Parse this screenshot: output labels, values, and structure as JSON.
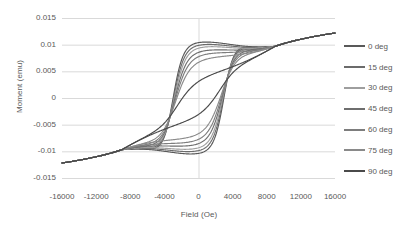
{
  "chart_data": {
    "type": "line",
    "title": "",
    "xlabel": "Field (Oe)",
    "ylabel": "Moment (emu)",
    "xlim": [
      -16000,
      16000
    ],
    "ylim": [
      -0.015,
      0.015
    ],
    "xticks": [
      "-16000",
      "-12000",
      "-8000",
      "-4000",
      "0",
      "4000",
      "8000",
      "12000",
      "16000"
    ],
    "xtick_values": [
      -16000,
      -12000,
      -8000,
      -4000,
      0,
      4000,
      8000,
      12000,
      16000
    ],
    "yticks": [
      "0.015",
      "0.01",
      "0.005",
      "0",
      "-0.005",
      "-0.01",
      "-0.015"
    ],
    "ytick_values": [
      0.015,
      0.01,
      0.005,
      0,
      -0.005,
      -0.01,
      -0.015
    ],
    "grid": true,
    "grid_color": "#d9d9d9",
    "legend_position": "right",
    "series": [
      {
        "name": "0 deg",
        "color": "#595959",
        "saturation": 0.0119,
        "remanence": 0.0082,
        "coercivity": 3050,
        "squareness": 0.88,
        "sharpness": 2.7
      },
      {
        "name": "15 deg",
        "color": "#6b6b6b",
        "saturation": 0.0119,
        "remanence": 0.008,
        "coercivity": 3000,
        "squareness": 0.84,
        "sharpness": 2.5
      },
      {
        "name": "30 deg",
        "color": "#9e9e9e",
        "saturation": 0.0119,
        "remanence": 0.0077,
        "coercivity": 2950,
        "squareness": 0.8,
        "sharpness": 2.3
      },
      {
        "name": "45 deg",
        "color": "#6e6e6e",
        "saturation": 0.0119,
        "remanence": 0.0074,
        "coercivity": 2900,
        "squareness": 0.74,
        "sharpness": 2.1
      },
      {
        "name": "60 deg",
        "color": "#7d7d7d",
        "saturation": 0.0119,
        "remanence": 0.007,
        "coercivity": 2850,
        "squareness": 0.68,
        "sharpness": 1.9
      },
      {
        "name": "75 deg",
        "color": "#8a8a8a",
        "saturation": 0.0119,
        "remanence": 0.0066,
        "coercivity": 2800,
        "squareness": 0.6,
        "sharpness": 1.7
      },
      {
        "name": "90 deg",
        "color": "#4a4a4a",
        "saturation": 0.0119,
        "remanence": 0.003,
        "coercivity": 2600,
        "squareness": 0.3,
        "sharpness": 1.3
      }
    ]
  },
  "legend": {
    "items": [
      {
        "label": "0 deg",
        "color": "#595959"
      },
      {
        "label": "15 deg",
        "color": "#6b6b6b"
      },
      {
        "label": "30 deg",
        "color": "#9e9e9e"
      },
      {
        "label": "45 deg",
        "color": "#6e6e6e"
      },
      {
        "label": "60 deg",
        "color": "#7d7d7d"
      },
      {
        "label": "75 deg",
        "color": "#8a8a8a"
      },
      {
        "label": "90 deg",
        "color": "#4a4a4a"
      }
    ]
  }
}
